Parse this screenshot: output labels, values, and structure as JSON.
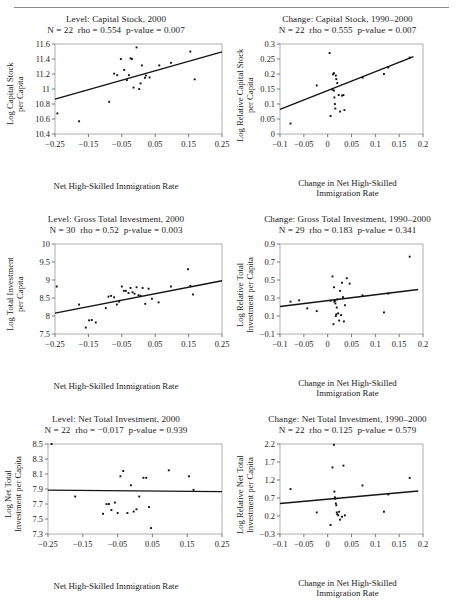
{
  "figure": {
    "rule": true,
    "panels": [
      {
        "id": "level-capital-stock",
        "title": "Level: Capital Stock, 2000",
        "stats_n": "N = 22",
        "stats_rho": "rho = 0.554",
        "stats_p": "p-value = 0.007",
        "ylabel_lines": [
          "Log Capital Stock",
          "per Capita"
        ],
        "xlabel_lines": [
          "Net High-Skilled Immigration Rate"
        ]
      },
      {
        "id": "change-capital-stock",
        "title": "Change: Capital Stock, 1990–2000",
        "stats_n": "N = 22",
        "stats_rho": "rho = 0.555",
        "stats_p": "p-value = 0.007",
        "ylabel_lines": [
          "Log Relative Capital Stock",
          "per Capita"
        ],
        "xlabel_lines": [
          "Change in Net High-Skilled",
          "Immigration Rate"
        ]
      },
      {
        "id": "level-gross-total-investment",
        "title": "Level: Gross Total Investment, 2000",
        "stats_n": "N = 30",
        "stats_rho": "rho = 0.52",
        "stats_p": "p-value = 0.003",
        "ylabel_lines": [
          "Log Total Investment",
          "per Capita"
        ],
        "xlabel_lines": [
          "Net High-Skilled Immigration Rate"
        ]
      },
      {
        "id": "change-gross-total-investment",
        "title": "Change: Gross Total Investment, 1990–2000",
        "stats_n": "N = 29",
        "stats_rho": "rho = 0.183",
        "stats_p": "p-value = 0.341",
        "ylabel_lines": [
          "Log Relative Total",
          "Investment per Capita"
        ],
        "xlabel_lines": [
          "Change in Net High-Skilled",
          "Immigration Rate"
        ]
      },
      {
        "id": "level-net-total-investment",
        "title": "Level: Net Total Investment, 2000",
        "stats_n": "N = 22",
        "stats_rho": "rho = −0.017",
        "stats_p": "p-value = 0.939",
        "ylabel_lines": [
          "Log Net Total",
          "Investment per Capita"
        ],
        "xlabel_lines": [
          "Net High-Skilled Immigration Rate"
        ]
      },
      {
        "id": "change-net-total-investment",
        "title": "Change: Net Total Investment, 1990–2000",
        "stats_n": "N = 22",
        "stats_rho": "rho = 0.125",
        "stats_p": "p-value = 0.579",
        "ylabel_lines": [
          "Log Relative Net Total",
          "Investment per Capita"
        ],
        "xlabel_lines": [
          "Change in Net High-Skilled",
          "Immigration Rate"
        ]
      }
    ]
  },
  "chart_data": [
    {
      "type": "scatter",
      "title": "Level: Capital Stock, 2000",
      "subtitle": "N = 22  rho = 0.554  p-value = 0.007",
      "xlabel": "Net High-Skilled Immigration Rate",
      "ylabel": "Log Capital Stock per Capita",
      "xlim": [
        -0.25,
        0.25
      ],
      "ylim": [
        10.4,
        11.6
      ],
      "xticks": [
        -0.25,
        -0.15,
        -0.05,
        0.05,
        0.15,
        0.25
      ],
      "xticklabels": [
        "−0.25",
        "−0.15",
        "−0.05",
        "0.05",
        "0.15",
        "0.25"
      ],
      "yticks": [
        10.4,
        10.6,
        10.8,
        11.0,
        11.2,
        11.4,
        11.6
      ],
      "yticklabels": [
        "10.4",
        "10.6",
        "10.8",
        "11",
        "11.2",
        "11.4",
        "11.6"
      ],
      "grid": false,
      "legend": "none",
      "x": [
        -0.243,
        -0.178,
        -0.088,
        -0.073,
        -0.064,
        -0.053,
        -0.043,
        -0.035,
        -0.029,
        -0.024,
        -0.02,
        -0.015,
        -0.006,
        0.002,
        0.006,
        0.01,
        0.019,
        0.022,
        0.033,
        0.062,
        0.097,
        0.155,
        0.168
      ],
      "y": [
        10.675,
        10.57,
        10.83,
        11.205,
        11.185,
        11.4,
        11.255,
        11.12,
        11.185,
        11.41,
        11.4,
        11.02,
        11.555,
        11.0,
        11.075,
        11.315,
        11.15,
        11.18,
        11.155,
        11.315,
        11.35,
        11.5,
        11.13
      ],
      "fit_line": {
        "x": [
          -0.25,
          0.25
        ],
        "y": [
          10.865,
          11.495
        ],
        "label": "least-squares fit"
      }
    },
    {
      "type": "scatter",
      "title": "Change: Capital Stock, 1990–2000",
      "subtitle": "N = 22  rho = 0.555  p-value = 0.007",
      "xlabel": "Change in Net High-Skilled Immigration Rate",
      "ylabel": "Log Relative Capital Stock per Capita",
      "xlim": [
        -0.1,
        0.2
      ],
      "ylim": [
        0,
        0.3
      ],
      "xticks": [
        -0.1,
        -0.05,
        0,
        0.05,
        0.1,
        0.15,
        0.2
      ],
      "xticklabels": [
        "−0.1",
        "−0.05",
        "0",
        "0.05",
        "0.1",
        "0.15",
        "0.2"
      ],
      "yticks": [
        0,
        0.05,
        0.1,
        0.15,
        0.2,
        0.25,
        0.3
      ],
      "yticklabels": [
        "0",
        "0.05",
        "0.1",
        "0.15",
        "0.2",
        "0.25",
        "0.3"
      ],
      "grid": false,
      "legend": "none",
      "x": [
        -0.078,
        -0.023,
        0.004,
        0.006,
        0.01,
        0.011,
        0.013,
        0.013,
        0.014,
        0.015,
        0.016,
        0.017,
        0.018,
        0.02,
        0.023,
        0.026,
        0.03,
        0.033,
        0.035,
        0.073,
        0.118,
        0.127,
        0.172
      ],
      "y": [
        0.035,
        0.162,
        0.27,
        0.06,
        0.148,
        0.199,
        0.203,
        0.145,
        0.122,
        0.1,
        0.085,
        0.195,
        0.183,
        0.17,
        0.13,
        0.075,
        0.128,
        0.13,
        0.08,
        0.188,
        0.2,
        0.222,
        0.255
      ],
      "fit_line": {
        "x": [
          -0.1,
          0.18
        ],
        "y": [
          0.082,
          0.258
        ],
        "label": "least-squares fit"
      }
    },
    {
      "type": "scatter",
      "title": "Level: Gross Total Investment, 2000",
      "subtitle": "N = 30  rho = 0.52  p-value = 0.003",
      "xlabel": "Net High-Skilled Immigration Rate",
      "ylabel": "Log Total Investment per Capita",
      "xlim": [
        -0.25,
        0.25
      ],
      "ylim": [
        7.5,
        10.0
      ],
      "xticks": [
        -0.25,
        -0.15,
        -0.05,
        0.05,
        0.15,
        0.25
      ],
      "xticklabels": [
        "−0.25",
        "−0.15",
        "−0.05",
        "0.05",
        "0.15",
        "0.25"
      ],
      "yticks": [
        7.5,
        8.0,
        8.5,
        9.0,
        9.5,
        10.0
      ],
      "yticklabels": [
        "7.5",
        "8",
        "8.5",
        "9",
        "9.5",
        "10"
      ],
      "grid": false,
      "legend": "none",
      "x": [
        -0.245,
        -0.178,
        -0.158,
        -0.148,
        -0.14,
        -0.128,
        -0.098,
        -0.09,
        -0.082,
        -0.073,
        -0.065,
        -0.058,
        -0.05,
        -0.044,
        -0.038,
        -0.03,
        -0.024,
        -0.018,
        -0.012,
        -0.006,
        0.0,
        0.006,
        0.012,
        0.02,
        0.03,
        0.04,
        0.06,
        0.097,
        0.148,
        0.155,
        0.163
      ],
      "y": [
        8.82,
        8.32,
        7.68,
        7.88,
        7.89,
        7.82,
        8.22,
        8.54,
        8.56,
        8.52,
        8.32,
        8.4,
        8.82,
        8.7,
        8.7,
        8.64,
        8.78,
        8.66,
        8.62,
        8.8,
        8.58,
        8.56,
        8.78,
        8.34,
        8.76,
        8.48,
        8.38,
        8.82,
        9.3,
        8.84,
        8.6
      ],
      "fit_line": {
        "x": [
          -0.25,
          0.25
        ],
        "y": [
          8.08,
          8.98
        ],
        "label": "least-squares fit"
      }
    },
    {
      "type": "scatter",
      "title": "Change: Gross Total Investment, 1990–2000",
      "subtitle": "N = 29  rho = 0.183  p-value = 0.341",
      "xlabel": "Change in Net High-Skilled Immigration Rate",
      "ylabel": "Log Relative Total Investment per Capita",
      "xlim": [
        -0.1,
        0.2
      ],
      "ylim": [
        -0.1,
        0.9
      ],
      "xticks": [
        -0.1,
        -0.05,
        0,
        0.05,
        0.1,
        0.15,
        0.2
      ],
      "xticklabels": [
        "−0.1",
        "−0.05",
        "0",
        "0.05",
        "0.1",
        "0.15",
        "0.2"
      ],
      "yticks": [
        -0.1,
        0.1,
        0.3,
        0.5,
        0.7,
        0.9
      ],
      "yticklabels": [
        "−0.1",
        "0.1",
        "0.3",
        "0.5",
        "0.7",
        "0.9"
      ],
      "grid": false,
      "legend": "none",
      "x": [
        -0.078,
        -0.06,
        -0.043,
        -0.023,
        0.006,
        0.01,
        0.012,
        0.013,
        0.014,
        0.015,
        0.016,
        0.017,
        0.018,
        0.019,
        0.02,
        0.022,
        0.024,
        0.026,
        0.028,
        0.03,
        0.032,
        0.034,
        0.036,
        0.04,
        0.046,
        0.073,
        0.118,
        0.127,
        0.172
      ],
      "y": [
        0.26,
        0.275,
        0.185,
        0.155,
        0.27,
        0.54,
        0.01,
        0.42,
        0.26,
        0.27,
        0.24,
        0.1,
        0.12,
        0.195,
        0.285,
        0.13,
        0.05,
        0.38,
        0.11,
        0.47,
        0.31,
        0.04,
        0.22,
        0.52,
        0.46,
        0.33,
        0.14,
        0.35,
        0.76
      ],
      "fit_line": {
        "x": [
          -0.1,
          0.19
        ],
        "y": [
          0.205,
          0.395
        ],
        "label": "least-squares fit"
      }
    },
    {
      "type": "scatter",
      "title": "Level: Net Total Investment, 2000",
      "subtitle": "N = 22  rho = −0.017  p-value = 0.939",
      "xlabel": "Net High-Skilled Immigration Rate",
      "ylabel": "Log Net Total Investment per Capita",
      "xlim": [
        -0.25,
        0.25
      ],
      "ylim": [
        7.3,
        8.5
      ],
      "xticks": [
        -0.25,
        -0.15,
        -0.05,
        0.05,
        0.15,
        0.25
      ],
      "xticklabels": [
        "−0.25",
        "−0.15",
        "−0.05",
        "0.05",
        "0.15",
        "0.25"
      ],
      "yticks": [
        7.3,
        7.5,
        7.7,
        7.9,
        8.1,
        8.3,
        8.5
      ],
      "yticklabels": [
        "7.3",
        "7.5",
        "7.7",
        "7.9",
        "8.1",
        "8.3",
        "8.5"
      ],
      "grid": false,
      "legend": "none",
      "x": [
        -0.24,
        -0.172,
        -0.092,
        -0.082,
        -0.075,
        -0.068,
        -0.058,
        -0.05,
        -0.042,
        -0.034,
        -0.022,
        -0.012,
        -0.004,
        0.004,
        0.012,
        0.024,
        0.032,
        0.04,
        0.046,
        0.097,
        0.155,
        0.168
      ],
      "y": [
        8.5,
        7.8,
        7.57,
        7.7,
        7.7,
        7.62,
        7.72,
        7.58,
        8.07,
        8.14,
        7.58,
        7.95,
        7.6,
        7.63,
        7.8,
        8.05,
        8.05,
        7.66,
        7.38,
        8.15,
        8.07,
        7.89
      ],
      "fit_line": {
        "x": [
          -0.25,
          0.25
        ],
        "y": [
          7.885,
          7.865
        ],
        "label": "least-squares fit"
      }
    },
    {
      "type": "scatter",
      "title": "Change: Net Total Investment, 1990–2000",
      "subtitle": "N = 22  rho = 0.125  p-value = 0.579",
      "xlabel": "Change in Net High-Skilled Immigration Rate",
      "ylabel": "Log Relative Net Total Investment per Capita",
      "xlim": [
        -0.1,
        0.2
      ],
      "ylim": [
        -0.3,
        2.2
      ],
      "xticks": [
        -0.1,
        -0.05,
        0,
        0.05,
        0.1,
        0.15,
        0.2
      ],
      "xticklabels": [
        "−0.1",
        "−0.05",
        "0",
        "0.05",
        "0.1",
        "0.15",
        "0.2"
      ],
      "yticks": [
        -0.3,
        0.2,
        0.7,
        1.2,
        1.7,
        2.2
      ],
      "yticklabels": [
        "−0.3",
        "0.2",
        "0.7",
        "1.2",
        "1.7",
        "2.2"
      ],
      "grid": false,
      "legend": "none",
      "x": [
        -0.078,
        -0.023,
        0.006,
        0.01,
        0.013,
        0.014,
        0.015,
        0.016,
        0.017,
        0.018,
        0.019,
        0.02,
        0.022,
        0.024,
        0.026,
        0.03,
        0.033,
        0.036,
        0.073,
        0.118,
        0.127,
        0.172
      ],
      "y": [
        0.95,
        0.3,
        -0.05,
        1.55,
        2.18,
        0.88,
        0.72,
        0.68,
        0.55,
        0.5,
        0.3,
        0.25,
        0.22,
        0.32,
        0.1,
        0.18,
        1.6,
        0.22,
        1.05,
        0.32,
        0.8,
        1.26
      ],
      "fit_line": {
        "x": [
          -0.1,
          0.19
        ],
        "y": [
          0.545,
          0.895
        ],
        "label": "least-squares fit"
      }
    }
  ]
}
